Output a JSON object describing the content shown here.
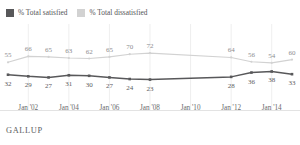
{
  "legend": {
    "items": [
      {
        "label": "% Total satisfied",
        "color": "#58585a",
        "key": "satisfied"
      },
      {
        "label": "% Total dissatisfied",
        "color": "#d2d2d2",
        "key": "dissatisfied"
      }
    ]
  },
  "footer": {
    "brand": "GALLUP"
  },
  "chart_data": {
    "type": "line",
    "title": "",
    "subtitle": "",
    "xlabel": "",
    "ylabel": "",
    "ylim": [
      0,
      100
    ],
    "grid": true,
    "legend_position": "top-left",
    "x_tick_labels": [
      "Jan '02",
      "Jan '04",
      "Jan '06",
      "Jan '08",
      "Jan '10",
      "Jan '12",
      "Jan '14"
    ],
    "x": [
      2001,
      2002,
      2003,
      2004,
      2005,
      2006,
      2007,
      2008,
      2009,
      2010,
      2012,
      2013,
      2014,
      2015
    ],
    "series": [
      {
        "name": "% Total dissatisfied",
        "color": "#d2d2d2",
        "values": [
          55,
          66,
          65,
          63,
          62,
          65,
          70,
          72,
          null,
          null,
          64,
          56,
          54,
          60
        ],
        "labels": [
          "55",
          "66",
          "65",
          "63",
          "62",
          "65",
          "70",
          "72",
          "",
          "",
          "64",
          "56",
          "54",
          "60"
        ],
        "label_side": "above"
      },
      {
        "name": "% Total satisfied",
        "color": "#58585a",
        "values": [
          32,
          29,
          27,
          31,
          30,
          27,
          24,
          23,
          null,
          null,
          28,
          36,
          38,
          33
        ],
        "labels": [
          "32",
          "29",
          "27",
          "31",
          "30",
          "27",
          "24",
          "23",
          "",
          "",
          "28",
          "36",
          "38",
          "33"
        ],
        "label_side": "below"
      }
    ]
  }
}
